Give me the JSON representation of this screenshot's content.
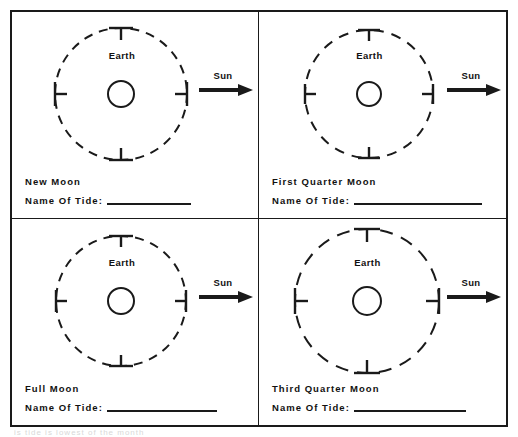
{
  "worksheet": {
    "title": "Moon Phases and Tides Worksheet",
    "scan_footer_sliver": "is tide is lowest of the month",
    "colors": {
      "ink": "#1a1a1a",
      "paper": "#ffffff"
    },
    "common_labels": {
      "earth": "Earth",
      "sun": "Sun",
      "tide_prompt": "Name Of Tide:",
      "tide_answer": ""
    },
    "panels": [
      {
        "id": "new-moon",
        "moon_name": "New Moon",
        "earth_label": "Earth",
        "sun_label": "Sun",
        "tide_prompt": "Name Of Tide:",
        "tide_answer": "",
        "orbit": {
          "radius": 66,
          "dash": "9 7",
          "earth_radius": 13,
          "tick_positions": [
            "north",
            "south",
            "east",
            "west"
          ]
        }
      },
      {
        "id": "first-quarter-moon",
        "moon_name": "First Quarter Moon",
        "earth_label": "Earth",
        "sun_label": "Sun",
        "tide_prompt": "Name Of Tide:",
        "tide_answer": "",
        "orbit": {
          "radius": 64,
          "dash": "10 8",
          "earth_radius": 12,
          "tick_positions": [
            "north",
            "south",
            "east",
            "west"
          ]
        }
      },
      {
        "id": "full-moon",
        "moon_name": "Full Moon",
        "earth_label": "Earth",
        "sun_label": "Sun",
        "tide_prompt": "Name Of Tide:",
        "tide_answer": "",
        "orbit": {
          "radius": 65,
          "dash": "9 7",
          "earth_radius": 13,
          "tick_positions": [
            "north",
            "south",
            "east",
            "west"
          ]
        }
      },
      {
        "id": "third-quarter-moon",
        "moon_name": "Third Quarter Moon",
        "earth_label": "Earth",
        "sun_label": "Sun",
        "tide_prompt": "Name Of Tide:",
        "tide_answer": "",
        "orbit": {
          "radius": 72,
          "dash": "13 9",
          "earth_radius": 14,
          "tick_positions": [
            "north",
            "south",
            "east",
            "west"
          ]
        }
      }
    ]
  }
}
